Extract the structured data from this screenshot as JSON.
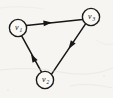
{
  "figure": {
    "kind": "directed-graph",
    "caption": "",
    "background_color": "#f6f5f2",
    "stroke_color": "#161616",
    "node_fill_color": "#faf9f6"
  },
  "graph": {
    "vertices": [
      {
        "id": "v1",
        "label": "v",
        "subscript": "1",
        "cx": 18,
        "cy": 28,
        "r": 8.6
      },
      {
        "id": "v2",
        "label": "v",
        "subscript": "2",
        "cx": 45,
        "cy": 80,
        "r": 8.6
      },
      {
        "id": "v3",
        "label": "v",
        "subscript": "3",
        "cx": 91,
        "cy": 17,
        "r": 8.6
      }
    ],
    "edges": [
      {
        "id": "e-v3-v1",
        "from": "v3",
        "to": "v1",
        "directed": true,
        "x1": 82.6,
        "y1": 19.6,
        "x2": 26.4,
        "y2": 25.4,
        "arrow_x": 52,
        "arrow_y": 22.4,
        "arrow_angle": 174
      },
      {
        "id": "e-v1-v2",
        "from": "v1",
        "to": "v2",
        "directed": true,
        "x1": 21.8,
        "y1": 36.2,
        "x2": 41.4,
        "y2": 71.8,
        "arrow_x": 31,
        "arrow_y": 54,
        "arrow_angle": 61
      },
      {
        "id": "e-v2-v3",
        "from": "v2",
        "to": "v3",
        "directed": true,
        "x1": 51.6,
        "y1": 74.2,
        "x2": 85.4,
        "y2": 24.2,
        "arrow_x": 68.5,
        "arrow_y": 49,
        "arrow_angle": -56
      }
    ]
  }
}
